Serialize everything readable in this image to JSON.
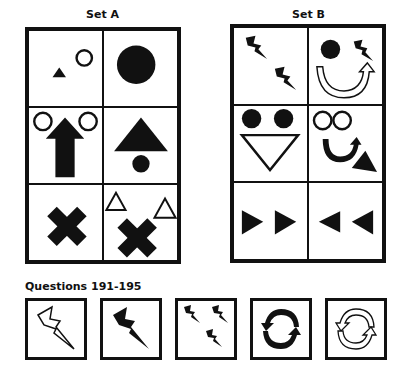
{
  "set_a": {
    "title": "Set A",
    "cells": [
      {
        "shapes": [
          "small-black-triangle",
          "small-white-circle"
        ]
      },
      {
        "shapes": [
          "large-black-circle"
        ]
      },
      {
        "shapes": [
          "white-circle",
          "black-up-arrow",
          "white-circle"
        ]
      },
      {
        "shapes": [
          "large-black-triangle",
          "small-black-circle"
        ]
      },
      {
        "shapes": [
          "black-x"
        ]
      },
      {
        "shapes": [
          "white-triangle",
          "black-x",
          "white-triangle"
        ]
      }
    ]
  },
  "set_b": {
    "title": "Set B",
    "cells": [
      {
        "shapes": [
          "black-lightning",
          "black-lightning"
        ]
      },
      {
        "shapes": [
          "black-circle",
          "black-lightning",
          "white-curved-arrow"
        ]
      },
      {
        "shapes": [
          "black-circle",
          "black-circle",
          "white-down-triangle"
        ]
      },
      {
        "shapes": [
          "white-circle",
          "white-circle",
          "black-curved-arrow",
          "black-triangle"
        ]
      },
      {
        "shapes": [
          "black-right-triangle",
          "black-right-triangle"
        ]
      },
      {
        "shapes": [
          "black-left-triangle",
          "black-left-triangle"
        ]
      }
    ]
  },
  "questions": {
    "title": "Questions 191-195",
    "items": [
      {
        "number": 191,
        "shape": "white-lightning"
      },
      {
        "number": 192,
        "shape": "black-lightning"
      },
      {
        "number": 193,
        "shape": "three-black-lightnings"
      },
      {
        "number": 194,
        "shape": "black-circular-arrows"
      },
      {
        "number": 195,
        "shape": "white-circular-arrows"
      }
    ]
  }
}
